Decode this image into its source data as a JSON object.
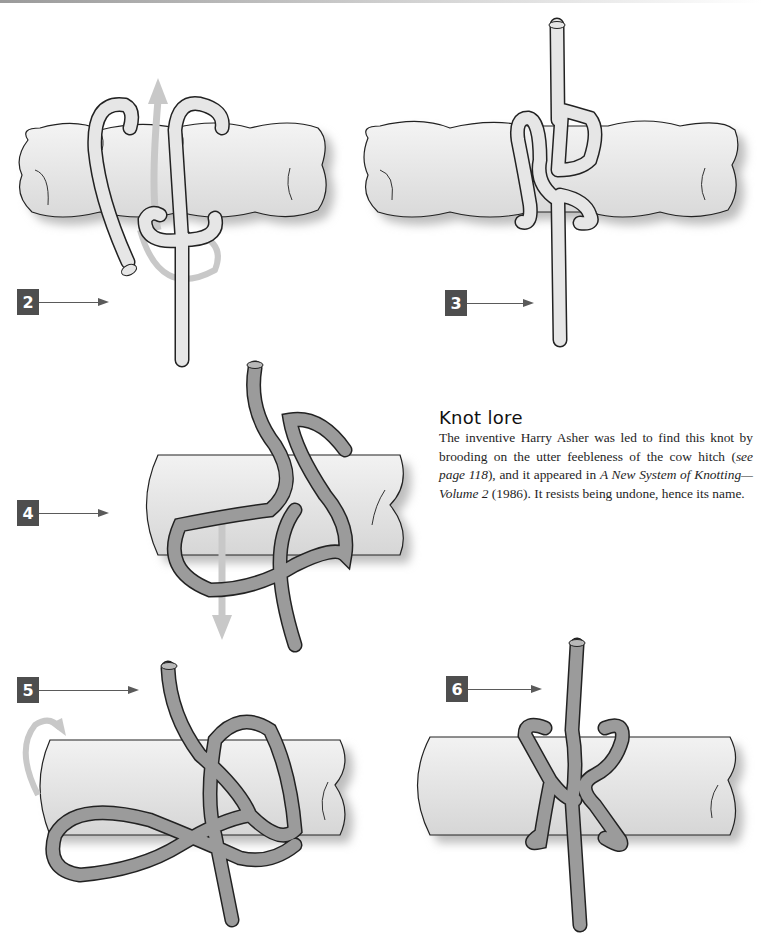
{
  "page": {
    "top_rule_color": "#9a9a9a"
  },
  "steps": [
    {
      "number": "2",
      "label_box_color": "#4e4e4e",
      "rope_color": "#e2e2e2",
      "support": "twisted-rope",
      "arrows": [
        "up-arrow",
        "loop-arrow"
      ]
    },
    {
      "number": "3",
      "label_box_color": "#4e4e4e",
      "rope_color": "#e2e2e2",
      "support": "twisted-rope",
      "arrows": []
    },
    {
      "number": "4",
      "label_box_color": "#4e4e4e",
      "rope_color": "#9b9b9b",
      "support": "pole",
      "arrows": [
        "down-arrow"
      ]
    },
    {
      "number": "5",
      "label_box_color": "#4e4e4e",
      "rope_color": "#9b9b9b",
      "support": "pole",
      "arrows": [
        "rotate-arrow"
      ]
    },
    {
      "number": "6",
      "label_box_color": "#4e4e4e",
      "rope_color": "#9b9b9b",
      "support": "pole",
      "arrows": []
    }
  ],
  "knot_lore": {
    "heading": "Knot lore",
    "text_1": "The inventive Harry Asher was led to find this knot by brooding on the utter feebleness of the cow hitch (",
    "italic_1": "see page 118",
    "text_2": "), and it appeared in ",
    "italic_2": "A New System of Knotting—Volume 2",
    "text_3": " (1986). It resists being undone, hence its name."
  }
}
